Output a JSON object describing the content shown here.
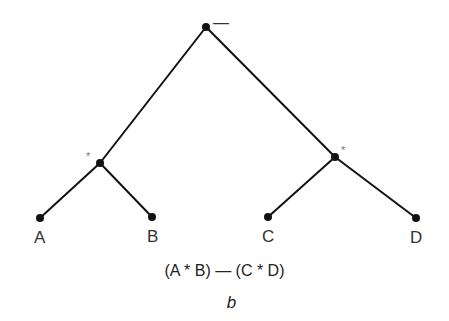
{
  "diagram": {
    "type": "expression-tree",
    "root": {
      "operator": "—"
    },
    "internal_nodes": [
      {
        "id": "left",
        "operator": "*"
      },
      {
        "id": "right",
        "operator": "*"
      }
    ],
    "leaves": [
      "A",
      "B",
      "C",
      "D"
    ],
    "expression": "(A * B) — (C * D)",
    "caption": "b"
  }
}
